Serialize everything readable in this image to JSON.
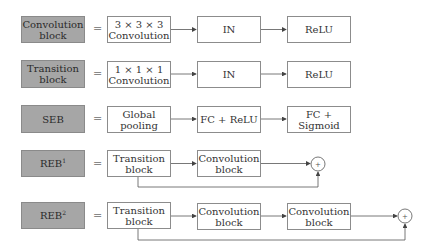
{
  "rows": [
    {
      "label": "Convolution block",
      "label_lines": [
        "Convolution",
        "block"
      ],
      "equals": "=",
      "nodes": [
        [
          "3 × 3 × 3",
          "Convolution"
        ],
        [
          "IN"
        ],
        [
          "ReLU"
        ]
      ]
    },
    {
      "label": "Transition block",
      "label_lines": [
        "Transition",
        "block"
      ],
      "equals": "=",
      "nodes": [
        [
          "1 × 1 × 1",
          "Convolution"
        ],
        [
          "IN"
        ],
        [
          "ReLU"
        ]
      ]
    },
    {
      "label": "SEB",
      "label_lines": [
        "SEB"
      ],
      "equals": "=",
      "nodes": [
        [
          "Global",
          "pooling"
        ],
        [
          "FC + ReLU"
        ],
        [
          "FC + Sigmoid"
        ]
      ]
    },
    {
      "label": "REB1",
      "label_base": "REB",
      "label_sup": "1",
      "equals": "=",
      "nodes": [
        [
          "Transition",
          "block"
        ],
        [
          "Convolution",
          "block"
        ]
      ],
      "sum": "+"
    },
    {
      "label": "REB2",
      "label_base": "REB",
      "label_sup": "2",
      "equals": "=",
      "nodes": [
        [
          "Transition",
          "block"
        ],
        [
          "Convolution",
          "block"
        ],
        [
          "Convolution",
          "block"
        ]
      ],
      "sum": "+"
    }
  ],
  "colors": {
    "label_fill": "#a6a6a6",
    "node_border": "#8c8c8c",
    "arrow": "#555555"
  }
}
